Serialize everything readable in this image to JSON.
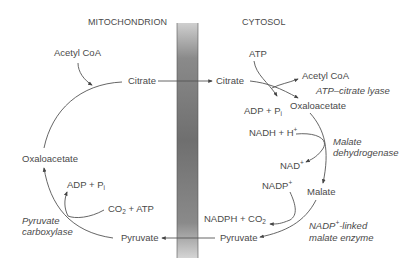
{
  "headers": {
    "mitochondrion": "MITOCHONDRION",
    "cytosol": "CYTOSOL"
  },
  "mitochondrion": {
    "acetyl_coa": "Acetyl CoA",
    "citrate": "Citrate",
    "oxaloacetate": "Oxaloacetate",
    "adp_pi": "ADP + P",
    "adp_pi_sub": "i",
    "co2_atp_a": "CO",
    "co2_atp_sub": "2",
    "co2_atp_b": " + ATP",
    "pyruvate": "Pyruvate",
    "enzyme_line1": "Pyruvate",
    "enzyme_line2": "carboxylase"
  },
  "cytosol": {
    "citrate": "Citrate",
    "atp": "ATP",
    "acetyl_coa": "Acetyl CoA",
    "atp_citrate_lyase": "ATP–citrate lyase",
    "adp_pi": "ADP + P",
    "adp_pi_sub": "i",
    "oxaloacetate": "Oxaloacetate",
    "nadh_h": "NADH + H",
    "nadh_h_sup": "+",
    "mdh_line1": "Malate",
    "mdh_line2": "dehydrogenase",
    "nad": "NAD",
    "nad_sup": "+",
    "nadp": "NADP",
    "nadp_sup": "+",
    "malate": "Malate",
    "nadph_co2_a": "NADPH + CO",
    "nadph_co2_sub": "2",
    "pyruvate": "Pyruvate",
    "me_line1_a": "NADP",
    "me_line1_sup": "+",
    "me_line1_b": "-linked",
    "me_line2": "malate enzyme"
  },
  "colors": {
    "text": "#4a4a4a",
    "membrane_dark": "#6e6e6e",
    "membrane_light": "#c8c8c8"
  }
}
